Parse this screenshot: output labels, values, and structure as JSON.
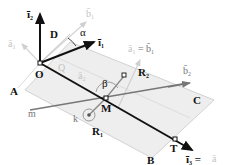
{
  "diagram": {
    "type": "3d-geometry",
    "points": {
      "O": {
        "label": "O"
      },
      "M": {
        "label": "M"
      },
      "T": {
        "label": "T"
      },
      "A": {
        "label": "A"
      },
      "B": {
        "label": "B"
      },
      "C": {
        "label": "C"
      },
      "D": {
        "label": "D"
      },
      "Q": {
        "label": "Q"
      },
      "R1": {
        "label": "R",
        "sub": "1"
      },
      "R2": {
        "label": "R",
        "sub": "2"
      }
    },
    "vectors": {
      "i1": {
        "label": "ī",
        "sub": "1"
      },
      "i2": {
        "label": "ī",
        "sub": "2"
      },
      "i3": {
        "label": "ī",
        "sub": "3",
        "suffix": " ="
      },
      "b2": {
        "label": "b̄",
        "sub": "2"
      },
      "a1_eq_b1": {
        "left": "ā",
        "left_sub": "1",
        "eq": " = ",
        "right": "b̄",
        "right_sub": "1"
      },
      "ghost_a1": {
        "label": "ā",
        "sub": "1"
      },
      "ghost_b1": {
        "label": "b̄",
        "sub": "1"
      },
      "ghost_a2": {
        "label": "ā",
        "sub": "2"
      }
    },
    "angles": {
      "alpha": "α",
      "beta": "β"
    },
    "lines": {
      "m": "m",
      "k": "k"
    },
    "colors": {
      "primary": "#111111",
      "secondary": "#777777",
      "ghost": "#c4c4c4",
      "plane_fill": "#ececec",
      "plane_edge": "#cfcfcf"
    }
  }
}
